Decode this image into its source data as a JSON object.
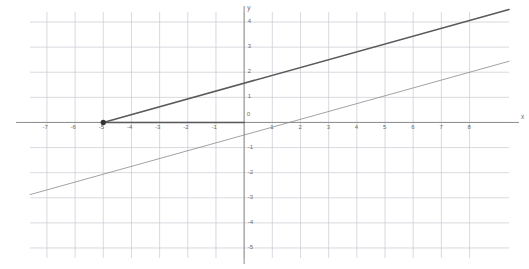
{
  "chart_data": {
    "type": "line",
    "title": "",
    "xlabel": "x",
    "ylabel": "y",
    "grid": true,
    "legend": false,
    "xlim": [
      -7.6,
      9.4
    ],
    "ylim": [
      -5.4,
      4.4
    ],
    "xticks": [
      -7,
      -6,
      -5,
      -4,
      -3,
      -2,
      -1,
      0,
      1,
      2,
      3,
      4,
      5,
      6,
      7,
      8
    ],
    "yticks": [
      -5,
      -4,
      -3,
      -2,
      -1,
      1,
      2,
      3,
      4
    ],
    "xtick_labels": [
      "-7",
      "-6",
      "-5",
      "-4",
      "-3",
      "-2",
      "-1",
      "0",
      "1",
      "2",
      "3",
      "4",
      "5",
      "6",
      "7",
      "8"
    ],
    "ytick_labels": [
      "-5",
      "-4",
      "-3",
      "-2",
      "-1",
      "1",
      "2",
      "3",
      "4"
    ],
    "series": [
      {
        "name": "thick-line",
        "style": "solid-thick",
        "color": "#5a5a5a",
        "slope": 0.3125,
        "intercept": 1.5625,
        "x_range": [
          -5,
          9.4
        ],
        "label": ""
      },
      {
        "name": "thin-line",
        "style": "solid-thin",
        "color": "#8a8a8a",
        "slope": 0.3125,
        "intercept": -0.5,
        "x_range": [
          -7.6,
          9.4
        ],
        "label": ""
      },
      {
        "name": "segment-to-origin",
        "style": "solid-thick",
        "color": "#5a5a5a",
        "points": [
          [
            -5,
            0
          ],
          [
            0,
            0
          ]
        ],
        "label": ""
      }
    ],
    "points": [
      {
        "name": "marked-point",
        "x": -5,
        "y": 0,
        "marker": "dot",
        "color": "#333333"
      }
    ],
    "colors": {
      "grid": "#c8c8d2",
      "axis": "#8d8d8d",
      "text": "#6b6b6b",
      "curve_thick": "#5a5a5a",
      "curve_thin": "#8a8a8a",
      "background": "#ffffff"
    }
  },
  "axes": {
    "x_axis_name": "x",
    "y_axis_name": "y"
  }
}
